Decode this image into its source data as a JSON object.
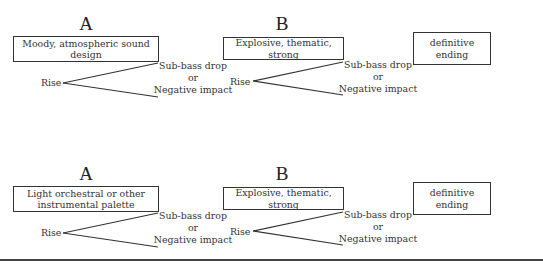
{
  "rows": [
    {
      "section_a": {
        "letter": "A",
        "box_text": "Moody, atmospheric sound design",
        "rise_label": "Rise",
        "drop_line1": "Sub-bass drop",
        "drop_line2": "or",
        "drop_line3": "Negative impact"
      },
      "section_b": {
        "letter": "B",
        "box_text": "Explosive, thematic, strong",
        "rise_label": "Rise",
        "drop_line1": "Sub-bass drop",
        "drop_line2": "or",
        "drop_line3": "Negative impact"
      },
      "ending": {
        "box_text": "definitive ending"
      }
    },
    {
      "section_a": {
        "letter": "A",
        "box_text_line1": "Light orchestral or other",
        "box_text_line2": "instrumental palette",
        "rise_label": "Rise",
        "drop_line1": "Sub-bass drop",
        "drop_line2": "or",
        "drop_line3": "Negative impact"
      },
      "section_b": {
        "letter": "B",
        "box_text": "Explosive, thematic, strong",
        "rise_label": "Rise",
        "drop_line1": "Sub-bass drop",
        "drop_line2": "or",
        "drop_line3": "Negative impact"
      },
      "ending": {
        "box_text": "definitive ending"
      }
    }
  ],
  "colors": {
    "line": "#333333",
    "text": "#333333",
    "background": "#ffffff"
  }
}
